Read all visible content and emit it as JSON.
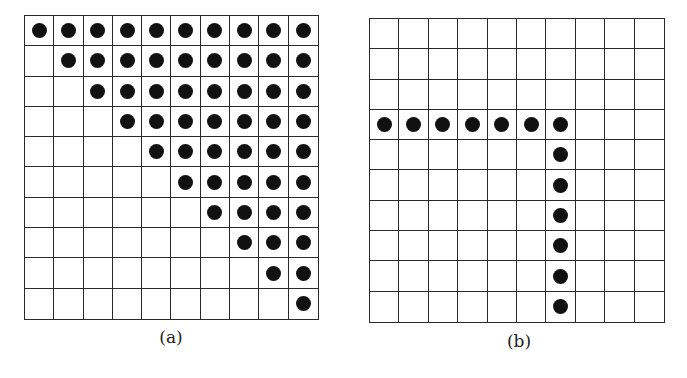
{
  "figure": {
    "panels": [
      {
        "id": "a",
        "caption": "(a)",
        "rows": 10,
        "cols": 10,
        "description": "Upper-triangular pattern: row r has filled dots in columns r..9",
        "filled": [
          [
            1,
            1,
            1,
            1,
            1,
            1,
            1,
            1,
            1,
            1
          ],
          [
            0,
            1,
            1,
            1,
            1,
            1,
            1,
            1,
            1,
            1
          ],
          [
            0,
            0,
            1,
            1,
            1,
            1,
            1,
            1,
            1,
            1
          ],
          [
            0,
            0,
            0,
            1,
            1,
            1,
            1,
            1,
            1,
            1
          ],
          [
            0,
            0,
            0,
            0,
            1,
            1,
            1,
            1,
            1,
            1
          ],
          [
            0,
            0,
            0,
            0,
            0,
            1,
            1,
            1,
            1,
            1
          ],
          [
            0,
            0,
            0,
            0,
            0,
            0,
            1,
            1,
            1,
            1
          ],
          [
            0,
            0,
            0,
            0,
            0,
            0,
            0,
            1,
            1,
            1
          ],
          [
            0,
            0,
            0,
            0,
            0,
            0,
            0,
            0,
            1,
            1
          ],
          [
            0,
            0,
            0,
            0,
            0,
            0,
            0,
            0,
            0,
            1
          ]
        ]
      },
      {
        "id": "b",
        "caption": "(b)",
        "rows": 10,
        "cols": 10,
        "description": "Hook pattern: row 3 columns 0-6 filled, column 6 rows 3-9 filled",
        "filled": [
          [
            0,
            0,
            0,
            0,
            0,
            0,
            0,
            0,
            0,
            0
          ],
          [
            0,
            0,
            0,
            0,
            0,
            0,
            0,
            0,
            0,
            0
          ],
          [
            0,
            0,
            0,
            0,
            0,
            0,
            0,
            0,
            0,
            0
          ],
          [
            1,
            1,
            1,
            1,
            1,
            1,
            1,
            0,
            0,
            0
          ],
          [
            0,
            0,
            0,
            0,
            0,
            0,
            1,
            0,
            0,
            0
          ],
          [
            0,
            0,
            0,
            0,
            0,
            0,
            1,
            0,
            0,
            0
          ],
          [
            0,
            0,
            0,
            0,
            0,
            0,
            1,
            0,
            0,
            0
          ],
          [
            0,
            0,
            0,
            0,
            0,
            0,
            1,
            0,
            0,
            0
          ],
          [
            0,
            0,
            0,
            0,
            0,
            0,
            1,
            0,
            0,
            0
          ],
          [
            0,
            0,
            0,
            0,
            0,
            0,
            1,
            0,
            0,
            0
          ]
        ]
      }
    ],
    "colors": {
      "grid_line": "#2a2a2a",
      "dot": "#111111",
      "background": "#ffffff"
    }
  }
}
